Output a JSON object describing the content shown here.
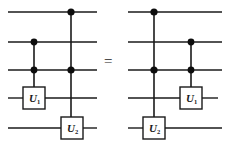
{
  "figure": {
    "kind": "quantum-circuit-identity",
    "relation_symbol": "=",
    "wire_count": 5,
    "colors": {
      "wire": "#1a1a1a",
      "control_dot": "#0d0d0d",
      "gate_border": "#1a1a1a",
      "gate_fill": "#ffffff",
      "background": "#ffffff",
      "text": "#1a1a1a"
    },
    "left_circuit": {
      "name": "left-circuit",
      "gates": [
        {
          "id": "left-gate-u1",
          "base": "U",
          "subscript": "1",
          "label": "U1",
          "target_wire": 4,
          "control_wires": [
            2,
            3
          ]
        },
        {
          "id": "left-gate-u2",
          "base": "U",
          "subscript": "2",
          "label": "U2",
          "target_wire": 5,
          "control_wires": [
            1,
            3
          ]
        }
      ]
    },
    "right_circuit": {
      "name": "right-circuit",
      "gates": [
        {
          "id": "right-gate-u2",
          "base": "U",
          "subscript": "2",
          "label": "U2",
          "target_wire": 5,
          "control_wires": [
            1,
            3
          ]
        },
        {
          "id": "right-gate-u1",
          "base": "U",
          "subscript": "1",
          "label": "U1",
          "target_wire": 4,
          "control_wires": [
            2,
            3
          ]
        }
      ]
    }
  }
}
